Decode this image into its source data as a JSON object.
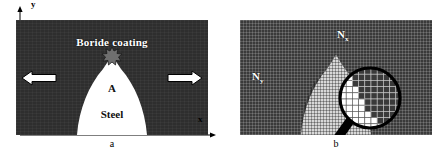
{
  "figure": {
    "panels": [
      {
        "id": "a",
        "caption": "a",
        "labels": {
          "coating": "Boride coating",
          "defect": "A",
          "substrate": "Steel",
          "axis_y": "y",
          "axis_x": "x"
        },
        "icons": {
          "arrow_left": "arrow-left-icon",
          "arrow_right": "arrow-right-icon",
          "defect_star": "star-defect-icon",
          "axis_y_arrow": "axis-y-arrow-icon",
          "axis_x_arrow": "axis-x-arrow-icon"
        },
        "colors": {
          "coating": "#2e2e2e",
          "substrate": "#ffffff",
          "defect": "#6f6f6f",
          "arrow_fill": "#ffffff",
          "arrow_stroke": "#000000"
        }
      },
      {
        "id": "b",
        "caption": "b",
        "labels": {
          "mesh_x": "N",
          "mesh_x_sub": "x",
          "mesh_y": "N",
          "mesh_y_sub": "y"
        },
        "icons": {
          "magnifier": "magnifier-icon"
        },
        "colors": {
          "mesh_coating": "#3a3a3a",
          "mesh_substrate": "#d8d8d8",
          "mesh_line": "#ffffff",
          "magnifier_stroke": "#000000",
          "cell_dark": "#3a3a3a",
          "cell_light": "#ffffff"
        },
        "magnifier_cells": {
          "cols": 10,
          "rows": 10,
          "grid": [
            [
              1,
              1,
              0,
              0,
              0,
              0,
              0,
              0,
              0,
              0
            ],
            [
              1,
              1,
              0,
              0,
              0,
              0,
              0,
              0,
              0,
              0
            ],
            [
              1,
              1,
              0,
              0,
              0,
              0,
              0,
              0,
              0,
              0
            ],
            [
              1,
              1,
              1,
              0,
              0,
              0,
              0,
              0,
              0,
              0
            ],
            [
              1,
              1,
              1,
              0,
              0,
              0,
              0,
              0,
              0,
              0
            ],
            [
              1,
              1,
              1,
              1,
              0,
              0,
              0,
              0,
              0,
              0
            ],
            [
              1,
              1,
              1,
              1,
              0,
              0,
              0,
              0,
              0,
              0
            ],
            [
              1,
              1,
              1,
              1,
              1,
              0,
              0,
              0,
              0,
              0
            ],
            [
              1,
              1,
              1,
              1,
              1,
              1,
              0,
              0,
              0,
              0
            ],
            [
              1,
              1,
              1,
              1,
              1,
              1,
              1,
              0,
              0,
              0
            ]
          ]
        }
      }
    ]
  }
}
